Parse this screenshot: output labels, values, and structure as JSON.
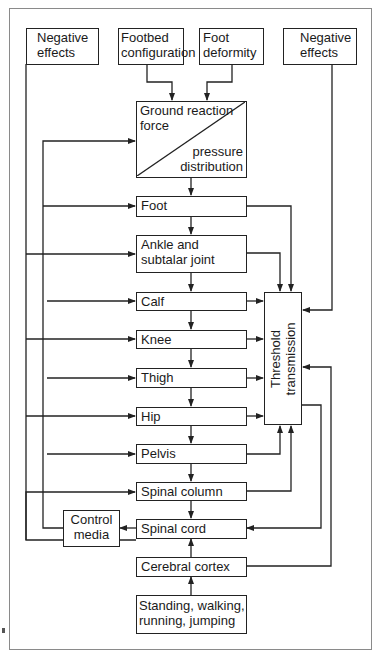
{
  "diagram": {
    "inputs": {
      "negative_effects_left": [
        "Negative",
        "effects"
      ],
      "footbed": [
        "Footbed",
        "configuration"
      ],
      "foot_deformity": [
        "Foot",
        "deformity"
      ],
      "negative_effects_right": [
        "Negative",
        "effects"
      ]
    },
    "ground_reaction": {
      "top_left": [
        "Ground reaction",
        "force"
      ],
      "bottom_right": [
        "pressure",
        "distribution"
      ]
    },
    "chain": [
      {
        "label": "Foot"
      },
      {
        "label": "Ankle and",
        "label2": "subtalar joint"
      },
      {
        "label": "Calf"
      },
      {
        "label": "Knee"
      },
      {
        "label": "Thigh"
      },
      {
        "label": "Hip"
      },
      {
        "label": "Pelvis"
      },
      {
        "label": "Spinal column"
      },
      {
        "label": "Spinal cord"
      },
      {
        "label": "Cerebral cortex"
      },
      {
        "label": "Standing, walking,",
        "label2": "running, jumping"
      }
    ],
    "threshold": [
      "Threshold",
      "transmission"
    ],
    "control_media": [
      "Control",
      "media"
    ],
    "colors": {
      "line": "#222222",
      "frame": "#8a8a8a",
      "background": "#ffffff"
    }
  }
}
